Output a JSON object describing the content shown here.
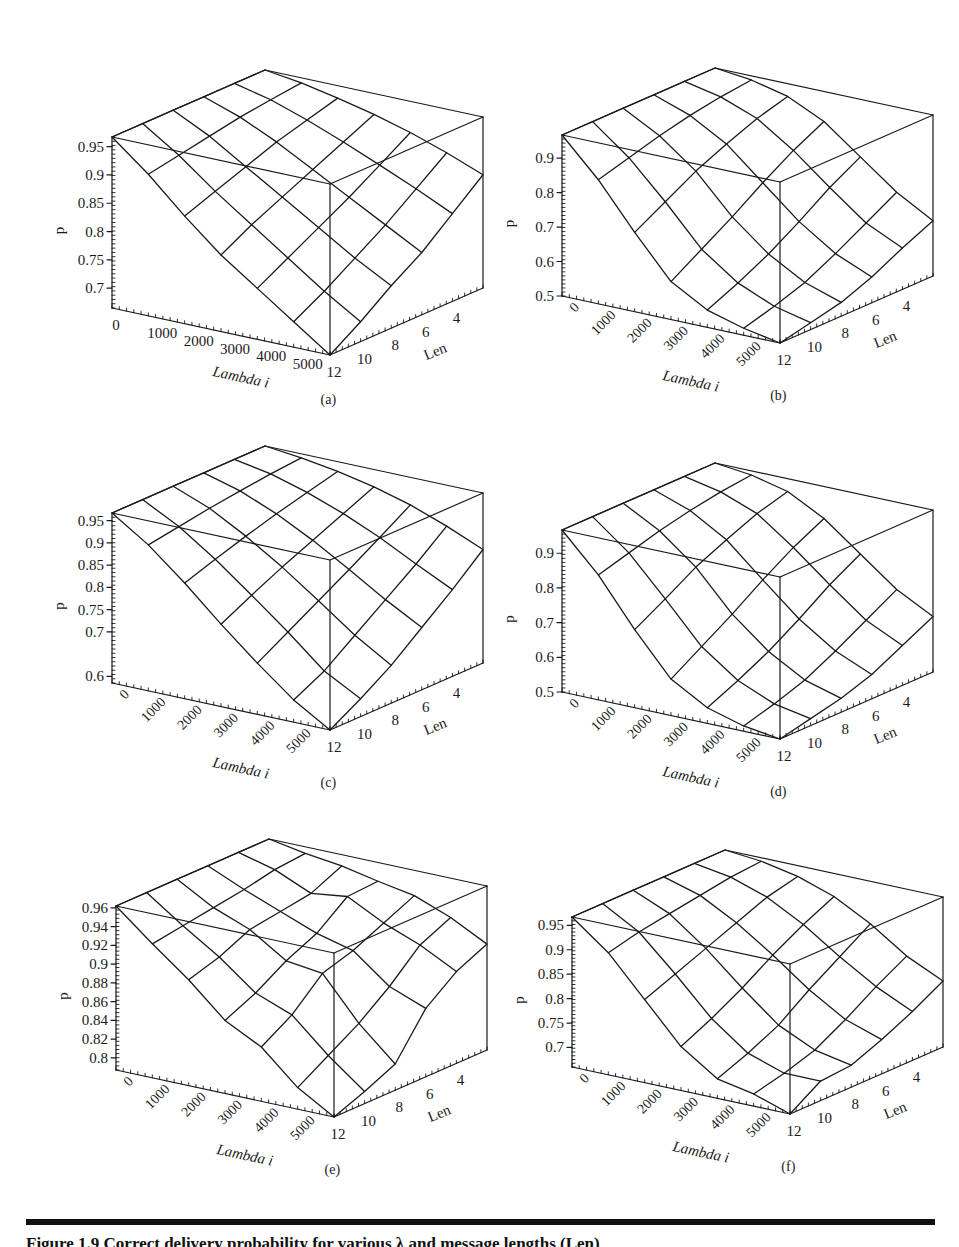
{
  "figure": {
    "caption": "Figure 1.9   Correct delivery probability for various λ and message lengths (Len)"
  },
  "chart_data": [
    {
      "id": "a",
      "type": "surface",
      "panel_label": "(a)",
      "xlabel": "Lambda i",
      "ylabel": "Len",
      "zlabel": "p",
      "x": [
        0,
        1000,
        2000,
        3000,
        4000,
        5000,
        6000
      ],
      "x_ticks": [
        "0",
        "1000",
        "2000",
        "3000",
        "4000",
        "5000"
      ],
      "y": [
        2,
        4,
        6,
        8,
        10,
        12
      ],
      "y_ticks": [
        "4",
        "6",
        "8",
        "10",
        "12"
      ],
      "zlim": [
        0.665,
        0.967
      ],
      "z_ticks": [
        "0.95",
        "0.9",
        "0.85",
        "0.8",
        "0.75",
        "0.7"
      ],
      "z_tick_values": [
        0.95,
        0.9,
        0.85,
        0.8,
        0.75,
        0.7
      ],
      "rotated_x_ticks": false,
      "grid": false,
      "z": [
        [
          0.967,
          0.958,
          0.945,
          0.93,
          0.912,
          0.89,
          0.865
        ],
        [
          0.967,
          0.952,
          0.93,
          0.905,
          0.878,
          0.85,
          0.82
        ],
        [
          0.967,
          0.945,
          0.915,
          0.88,
          0.845,
          0.81,
          0.775
        ],
        [
          0.967,
          0.935,
          0.895,
          0.855,
          0.815,
          0.775,
          0.74
        ],
        [
          0.967,
          0.925,
          0.875,
          0.83,
          0.785,
          0.74,
          0.7
        ],
        [
          0.967,
          0.915,
          0.855,
          0.8,
          0.755,
          0.71,
          0.665
        ]
      ]
    },
    {
      "id": "b",
      "type": "surface",
      "panel_label": "(b)",
      "xlabel": "Lambda i",
      "ylabel": "Len",
      "zlabel": "p",
      "x": [
        0,
        1000,
        2000,
        3000,
        4000,
        5000,
        6000
      ],
      "x_ticks": [
        "0",
        "1000",
        "2000",
        "3000",
        "4000",
        "5000"
      ],
      "y": [
        2,
        4,
        6,
        8,
        10,
        12
      ],
      "y_ticks": [
        "4",
        "6",
        "8",
        "10",
        "12"
      ],
      "zlim": [
        0.5,
        0.967
      ],
      "z_ticks": [
        "0.9",
        "0.8",
        "0.7",
        "0.6",
        "0.5"
      ],
      "z_tick_values": [
        0.9,
        0.8,
        0.7,
        0.6,
        0.5
      ],
      "rotated_x_ticks": true,
      "grid": false,
      "z": [
        [
          0.967,
          0.955,
          0.93,
          0.88,
          0.8,
          0.72,
          0.66
        ],
        [
          0.967,
          0.945,
          0.905,
          0.835,
          0.75,
          0.67,
          0.62
        ],
        [
          0.967,
          0.93,
          0.87,
          0.78,
          0.69,
          0.62,
          0.575
        ],
        [
          0.967,
          0.91,
          0.83,
          0.72,
          0.635,
          0.575,
          0.54
        ],
        [
          0.967,
          0.885,
          0.78,
          0.665,
          0.59,
          0.545,
          0.52
        ],
        [
          0.967,
          0.86,
          0.73,
          0.61,
          0.55,
          0.52,
          0.5
        ]
      ]
    },
    {
      "id": "c",
      "type": "surface",
      "panel_label": "(c)",
      "xlabel": "Lambda i",
      "ylabel": "Len",
      "zlabel": "p",
      "x": [
        0,
        1000,
        2000,
        3000,
        4000,
        5000,
        6000
      ],
      "x_ticks": [
        "0",
        "1000",
        "2000",
        "3000",
        "4000",
        "5000"
      ],
      "y": [
        2,
        4,
        6,
        8,
        10,
        12
      ],
      "y_ticks": [
        "4",
        "6",
        "8",
        "10",
        "12"
      ],
      "zlim": [
        0.585,
        0.967
      ],
      "z_ticks": [
        "0.95",
        "0.9",
        "0.85",
        "0.8",
        "0.75",
        "0.7",
        "0.6"
      ],
      "z_tick_values": [
        0.95,
        0.9,
        0.85,
        0.8,
        0.75,
        0.7,
        0.6
      ],
      "rotated_x_ticks": true,
      "grid": false,
      "z": [
        [
          0.967,
          0.958,
          0.945,
          0.928,
          0.905,
          0.875,
          0.84
        ],
        [
          0.967,
          0.952,
          0.928,
          0.898,
          0.862,
          0.82,
          0.78
        ],
        [
          0.967,
          0.944,
          0.91,
          0.868,
          0.82,
          0.77,
          0.725
        ],
        [
          0.967,
          0.935,
          0.89,
          0.838,
          0.78,
          0.72,
          0.67
        ],
        [
          0.967,
          0.924,
          0.868,
          0.805,
          0.74,
          0.67,
          0.625
        ],
        [
          0.967,
          0.913,
          0.845,
          0.77,
          0.7,
          0.635,
          0.585
        ]
      ]
    },
    {
      "id": "d",
      "type": "surface",
      "panel_label": "(d)",
      "xlabel": "Lambda i",
      "ylabel": "Len",
      "zlabel": "p",
      "x": [
        0,
        1000,
        2000,
        3000,
        4000,
        5000,
        6000
      ],
      "x_ticks": [
        "0",
        "1000",
        "2000",
        "3000",
        "4000",
        "5000"
      ],
      "y": [
        2,
        4,
        6,
        8,
        10,
        12
      ],
      "y_ticks": [
        "4",
        "6",
        "8",
        "10",
        "12"
      ],
      "zlim": [
        0.5,
        0.967
      ],
      "z_ticks": [
        "0.9",
        "0.8",
        "0.7",
        "0.6",
        "0.5"
      ],
      "z_tick_values": [
        0.9,
        0.8,
        0.7,
        0.6,
        0.5
      ],
      "rotated_x_ticks": true,
      "grid": false,
      "z": [
        [
          0.967,
          0.955,
          0.93,
          0.875,
          0.795,
          0.715,
          0.66
        ],
        [
          0.967,
          0.945,
          0.905,
          0.83,
          0.745,
          0.665,
          0.615
        ],
        [
          0.967,
          0.93,
          0.868,
          0.775,
          0.685,
          0.615,
          0.57
        ],
        [
          0.967,
          0.91,
          0.828,
          0.715,
          0.63,
          0.57,
          0.54
        ],
        [
          0.967,
          0.885,
          0.775,
          0.66,
          0.585,
          0.54,
          0.52
        ],
        [
          0.967,
          0.86,
          0.725,
          0.605,
          0.545,
          0.515,
          0.5
        ]
      ]
    },
    {
      "id": "e",
      "type": "surface",
      "panel_label": "(e)",
      "xlabel": "Lambda i",
      "ylabel": "Len",
      "zlabel": "p",
      "x": [
        0,
        1000,
        2000,
        3000,
        4000,
        5000,
        6000
      ],
      "x_ticks": [
        "0",
        "1000",
        "2000",
        "3000",
        "4000",
        "5000"
      ],
      "y": [
        2,
        4,
        6,
        8,
        10,
        12
      ],
      "y_ticks": [
        "4",
        "6",
        "8",
        "10",
        "12"
      ],
      "zlim": [
        0.787,
        0.962
      ],
      "z_ticks": [
        "0.96",
        "0.94",
        "0.92",
        "0.9",
        "0.88",
        "0.86",
        "0.84",
        "0.82",
        "0.8"
      ],
      "z_tick_values": [
        0.96,
        0.94,
        0.92,
        0.9,
        0.88,
        0.86,
        0.84,
        0.82,
        0.8
      ],
      "rotated_x_ticks": true,
      "grid": false,
      "z": [
        [
          0.962,
          0.955,
          0.95,
          0.942,
          0.935,
          0.92,
          0.9
        ],
        [
          0.962,
          0.952,
          0.935,
          0.94,
          0.92,
          0.905,
          0.885
        ],
        [
          0.962,
          0.945,
          0.93,
          0.915,
          0.905,
          0.875,
          0.86
        ],
        [
          0.962,
          0.94,
          0.925,
          0.9,
          0.895,
          0.85,
          0.815
        ],
        [
          0.962,
          0.935,
          0.91,
          0.88,
          0.865,
          0.83,
          0.8
        ],
        [
          0.962,
          0.93,
          0.9,
          0.865,
          0.845,
          0.81,
          0.787
        ]
      ]
    },
    {
      "id": "f",
      "type": "surface",
      "panel_label": "(f)",
      "xlabel": "Lambda i",
      "ylabel": "Len",
      "zlabel": "p",
      "x": [
        0,
        1000,
        2000,
        3000,
        4000,
        5000,
        6000
      ],
      "x_ticks": [
        "0",
        "1000",
        "2000",
        "3000",
        "4000",
        "5000"
      ],
      "y": [
        2,
        4,
        6,
        8,
        10,
        12
      ],
      "y_ticks": [
        "4",
        "6",
        "8",
        "10",
        "12"
      ],
      "zlim": [
        0.66,
        0.967
      ],
      "z_ticks": [
        "0.95",
        "0.9",
        "0.85",
        "0.8",
        "0.75",
        "0.7"
      ],
      "z_tick_values": [
        0.95,
        0.9,
        0.85,
        0.8,
        0.75,
        0.7
      ],
      "rotated_x_ticks": true,
      "grid": false,
      "z": [
        [
          0.967,
          0.96,
          0.945,
          0.92,
          0.88,
          0.83,
          0.795
        ],
        [
          0.967,
          0.955,
          0.93,
          0.89,
          0.84,
          0.795,
          0.76
        ],
        [
          0.967,
          0.945,
          0.905,
          0.855,
          0.8,
          0.755,
          0.73
        ],
        [
          0.967,
          0.935,
          0.88,
          0.815,
          0.755,
          0.72,
          0.705
        ],
        [
          0.967,
          0.925,
          0.855,
          0.78,
          0.725,
          0.7,
          0.7
        ],
        [
          0.967,
          0.91,
          0.83,
          0.75,
          0.7,
          0.685,
          0.66
        ]
      ]
    }
  ]
}
